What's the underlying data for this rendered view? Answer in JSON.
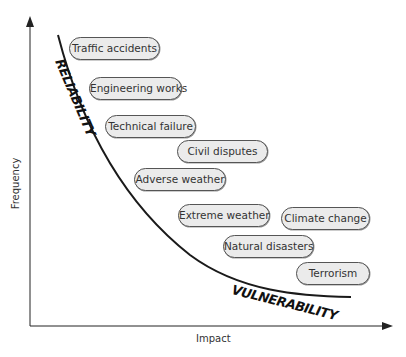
{
  "diagram": {
    "axes": {
      "x_label": "Impact",
      "y_label": "Frequency"
    },
    "curve_labels": {
      "upper": "RELIABILITY",
      "lower": "VULNERABILITY"
    },
    "items": [
      {
        "label": "Traffic accidents",
        "x": 69,
        "y": 37,
        "w": 91
      },
      {
        "label": "Engineering works",
        "x": 89,
        "y": 77,
        "w": 93
      },
      {
        "label": "Technical failure",
        "x": 105,
        "y": 115,
        "w": 91
      },
      {
        "label": "Civil disputes",
        "x": 177,
        "y": 140,
        "w": 91
      },
      {
        "label": "Adverse weather",
        "x": 134,
        "y": 168,
        "w": 92
      },
      {
        "label": "Extreme weather",
        "x": 178,
        "y": 204,
        "w": 92
      },
      {
        "label": "Climate change",
        "x": 281,
        "y": 207,
        "w": 89
      },
      {
        "label": "Natural disasters",
        "x": 223,
        "y": 235,
        "w": 91
      },
      {
        "label": "Terrorism",
        "x": 296,
        "y": 262,
        "w": 74
      }
    ],
    "colors": {
      "pill_fill": "#ebebeb",
      "pill_border": "#555555",
      "line": "#1a1a1a",
      "text": "#333333"
    }
  }
}
